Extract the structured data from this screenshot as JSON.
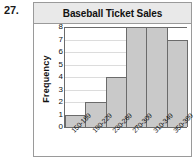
{
  "problem": {
    "number": "27."
  },
  "chart_data": {
    "type": "bar",
    "title": "Baseball Ticket Sales",
    "xlabel": "",
    "ylabel": "Frequency",
    "categories": [
      "150-189",
      "190-229",
      "230-269",
      "270-309",
      "310-349",
      "350-389"
    ],
    "values": [
      1,
      2,
      4,
      8,
      8,
      7
    ],
    "ylim": [
      0,
      8
    ],
    "yticks": [
      0,
      1,
      2,
      3,
      4,
      5,
      6,
      7,
      8
    ],
    "ytick_labels": [
      "0",
      "1",
      "2",
      "3",
      "4",
      "5",
      "6",
      "7",
      "8"
    ],
    "grid": true,
    "legend": null,
    "bar_color": "#c9c9c9",
    "bar_edge_color": "#6b6b6b"
  }
}
